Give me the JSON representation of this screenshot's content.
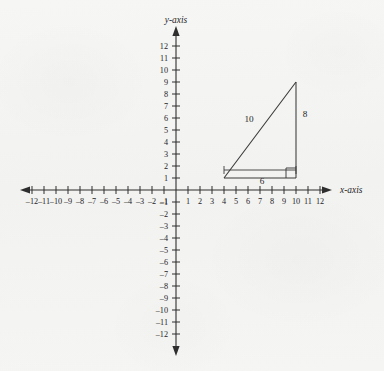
{
  "figure": {
    "background_color": "#f4f4f3",
    "ink_color": "#2e2e2e",
    "x_axis_label": "x-axis",
    "y_axis_label": "y-axis"
  },
  "chart_data": {
    "type": "scatter",
    "title": "",
    "xlabel": "x-axis",
    "ylabel": "y-axis",
    "xlim": [
      -13,
      13
    ],
    "ylim": [
      -13,
      13
    ],
    "grid": false,
    "legend": "none",
    "axis_style": "cartesian-cross-with-arrows",
    "x_ticks": [
      -12,
      -11,
      -10,
      -9,
      -8,
      -7,
      -6,
      -5,
      -4,
      -3,
      -2,
      -1,
      1,
      2,
      3,
      4,
      5,
      6,
      7,
      8,
      9,
      10,
      11,
      12
    ],
    "x_tick_labels": [
      "-12",
      "-11",
      "-10",
      "-9",
      "-8",
      "-7",
      "-6",
      "-5",
      "-4",
      "-3",
      "-2",
      "-1",
      "1",
      "2",
      "3",
      "4",
      "5",
      "6",
      "7",
      "8",
      "9",
      "10",
      "11",
      "12"
    ],
    "y_ticks": [
      12,
      11,
      10,
      9,
      8,
      7,
      6,
      5,
      4,
      3,
      2,
      1,
      -1,
      -2,
      -3,
      -4,
      -5,
      -6,
      -7,
      -8,
      -9,
      -10,
      -11,
      -12
    ],
    "y_tick_labels": [
      "12",
      "11",
      "10",
      "9",
      "8",
      "7",
      "6",
      "5",
      "4",
      "3",
      "2",
      "1",
      "-1",
      "-2",
      "-3",
      "-4",
      "-5",
      "-6",
      "-7",
      "-8",
      "-9",
      "-10",
      "-11",
      "-12"
    ],
    "shapes": [
      {
        "name": "right-triangle",
        "kind": "polygon",
        "vertices": [
          [
            4,
            1
          ],
          [
            10,
            1
          ],
          [
            10,
            9
          ]
        ],
        "closed": true,
        "right_angle_at": [
          10,
          1
        ],
        "side_labels": [
          {
            "text": "10",
            "side": "hypotenuse",
            "value": 10
          },
          {
            "text": "8",
            "side": "vertical-leg",
            "value": 8
          },
          {
            "text": "6",
            "side": "horizontal-leg",
            "value": 6
          }
        ]
      }
    ],
    "annotations": [
      {
        "text": "10",
        "x": 6.2,
        "y": 5.2
      },
      {
        "text": "8",
        "x": 10.8,
        "y": 5.4
      },
      {
        "text": "6",
        "x": 7.0,
        "y": 0.35
      }
    ]
  },
  "labels": {
    "hypotenuse": "10",
    "vertical_leg": "8",
    "horizontal_leg": "6"
  }
}
